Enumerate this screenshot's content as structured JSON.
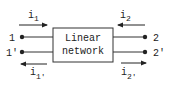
{
  "diagram": {
    "box_label_line1": "Linear",
    "box_label_line2": "network",
    "terminals": {
      "t1": "1",
      "t1p": "1'",
      "t2": "2",
      "t2p": "2'"
    },
    "currents": {
      "i1": {
        "base": "i",
        "sub": "1",
        "direction": "right"
      },
      "i1p": {
        "base": "i",
        "sub": "1'",
        "direction": "left"
      },
      "i2": {
        "base": "i",
        "sub": "2",
        "direction": "left"
      },
      "i2p": {
        "base": "i",
        "sub": "2'",
        "direction": "right"
      }
    }
  }
}
